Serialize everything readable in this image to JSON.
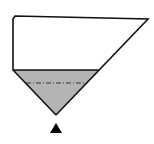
{
  "diagram": {
    "type": "hopper-fill-level",
    "colors": {
      "outline": "#111111",
      "fill": "#b4b4b4",
      "background": "#ffffff",
      "reference_line": "#333333",
      "marker": "#000000"
    },
    "fill_fraction_of_height": 0.46,
    "elements": [
      {
        "name": "tank-outline",
        "kind": "outline"
      },
      {
        "name": "material-fill",
        "kind": "filled-region"
      },
      {
        "name": "fill-surface-line",
        "kind": "surface"
      },
      {
        "name": "reference-level-line",
        "kind": "dash-dot"
      },
      {
        "name": "discharge-marker",
        "kind": "triangle-pointer"
      }
    ]
  }
}
